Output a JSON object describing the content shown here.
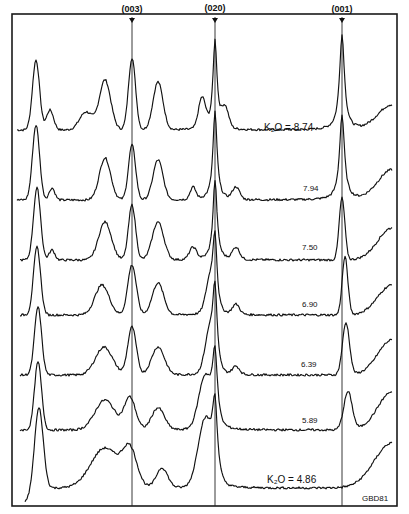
{
  "chart_data": {
    "type": "line",
    "title": "",
    "xlabel": "",
    "ylabel": "",
    "grid": false,
    "legend": "none",
    "peak_markers": [
      {
        "label": "(003)",
        "x_px": 132
      },
      {
        "label": "(020)",
        "x_px": 215
      },
      {
        "label": "(001)",
        "x_px": 342
      }
    ],
    "series": [
      {
        "name": "K2O = 8.74",
        "label": "K₂O = 8.74",
        "baseline_px": 130
      },
      {
        "name": "7.94",
        "label": "7.94",
        "baseline_px": 200
      },
      {
        "name": "7.50",
        "label": "7.50",
        "baseline_px": 260
      },
      {
        "name": "6.90",
        "label": "6.90",
        "baseline_px": 315
      },
      {
        "name": "6.39",
        "label": "6.39",
        "baseline_px": 375
      },
      {
        "name": "5.89",
        "label": "5.89",
        "baseline_px": 430
      },
      {
        "name": "K2O = 4.86",
        "label": "K₂O = 4.86",
        "baseline_px": 488
      }
    ],
    "annotations": [
      "GBD81"
    ]
  },
  "figure": {
    "peak_labels": [
      "(003)",
      "(020)",
      "(001)"
    ],
    "trace_labels": [
      "K₂O = 8.74",
      "7.94",
      "7.50",
      "6.90",
      "6.39",
      "5.89",
      "K₂O = 4.86"
    ],
    "code": "GBD81"
  }
}
